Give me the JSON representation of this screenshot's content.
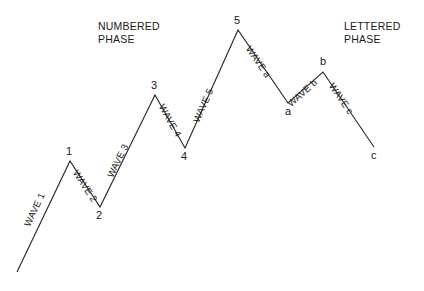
{
  "canvas": {
    "width": 424,
    "height": 291,
    "background": "#ffffff",
    "line_color": "#2b2b2b"
  },
  "headings": {
    "numbered": "NUMBERED\nPHASE",
    "lettered": "LETTERED\nPHASE"
  },
  "vertices": [
    {
      "id": "start",
      "label": "",
      "x": 17,
      "y": 272,
      "label_x": 0,
      "label_y": 0
    },
    {
      "id": "p1",
      "label": "1",
      "x": 70,
      "y": 161,
      "label_x": 66,
      "label_y": 146
    },
    {
      "id": "p2",
      "label": "2",
      "x": 100,
      "y": 207,
      "label_x": 96,
      "label_y": 210
    },
    {
      "id": "p3",
      "label": "3",
      "x": 155,
      "y": 95,
      "label_x": 151,
      "label_y": 80
    },
    {
      "id": "p4",
      "label": "4",
      "x": 185,
      "y": 148,
      "label_x": 181,
      "label_y": 151
    },
    {
      "id": "p5",
      "label": "5",
      "x": 238,
      "y": 30,
      "label_x": 234,
      "label_y": 15
    },
    {
      "id": "pa",
      "label": "a",
      "x": 288,
      "y": 103,
      "label_x": 285,
      "label_y": 106
    },
    {
      "id": "pb",
      "label": "b",
      "x": 323,
      "y": 72,
      "label_x": 320,
      "label_y": 56
    },
    {
      "id": "pc",
      "label": "c",
      "x": 374,
      "y": 147,
      "label_x": 371,
      "label_y": 150
    }
  ],
  "segments": [
    {
      "id": "wave-1",
      "label": "WAVE 1",
      "from": "start",
      "to": "p1",
      "label_x": 27,
      "label_y": 221,
      "rotation": -64.5
    },
    {
      "id": "wave-2",
      "label": "WAVE 2",
      "from": "p1",
      "to": "p2",
      "label_x": 75,
      "label_y": 166,
      "rotation": 57.0
    },
    {
      "id": "wave-3",
      "label": "WAVE 3",
      "from": "p2",
      "to": "p3",
      "label_x": 110,
      "label_y": 172,
      "rotation": -63.8
    },
    {
      "id": "wave-4",
      "label": "WAVE 4",
      "from": "p3",
      "to": "p4",
      "label_x": 161,
      "label_y": 100,
      "rotation": 60.5
    },
    {
      "id": "wave-5",
      "label": "WAVE 5",
      "from": "p4",
      "to": "p5",
      "label_x": 196,
      "label_y": 117,
      "rotation": -65.8
    },
    {
      "id": "wave-a",
      "label": "WAVE a",
      "from": "p5",
      "to": "pa",
      "label_x": 248,
      "label_y": 42,
      "rotation": 55.6
    },
    {
      "id": "wave-b",
      "label": "WAVE b",
      "from": "pa",
      "to": "pb",
      "label_x": 289,
      "label_y": 100,
      "rotation": -41.5
    },
    {
      "id": "wave-c",
      "label": "WAVE c",
      "from": "pb",
      "to": "pc",
      "label_x": 331,
      "label_y": 79,
      "rotation": 55.8
    }
  ],
  "polyline_points": "17,272 70,161 100,207 155,95 185,148 238,30 288,103 323,72 374,147"
}
